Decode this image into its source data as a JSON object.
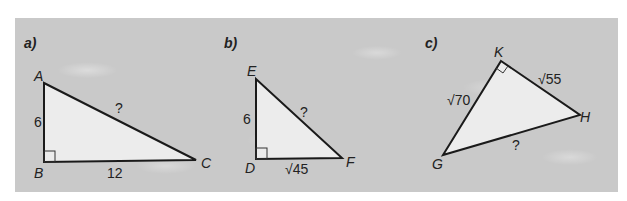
{
  "figures": [
    {
      "part_label": "a)",
      "vertices": {
        "A": "A",
        "B": "B",
        "C": "C"
      },
      "right_angle_at": "B",
      "sides": {
        "AB": "6",
        "BC": "12",
        "AC": "?"
      }
    },
    {
      "part_label": "b)",
      "vertices": {
        "E": "E",
        "D": "D",
        "F": "F"
      },
      "right_angle_at": "D",
      "sides": {
        "ED": "6",
        "DF": "√45",
        "EF": "?"
      }
    },
    {
      "part_label": "c)",
      "vertices": {
        "K": "K",
        "G": "G",
        "H": "H"
      },
      "right_angle_at": "K",
      "sides": {
        "GK": "√70",
        "KH": "√55",
        "GH": "?"
      }
    }
  ],
  "colors": {
    "panel": "#c9c9c9",
    "triangle_fill": "#ececec",
    "stroke": "#1a1a1a"
  }
}
